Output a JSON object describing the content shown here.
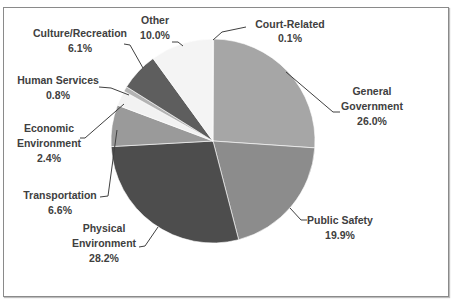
{
  "chart_data": {
    "type": "pie",
    "title": "",
    "start_angle": "12 o'clock, clockwise",
    "categories": [
      "Court-Related",
      "General Government",
      "Public Safety",
      "Physical Environment",
      "Transportation",
      "Economic Environment",
      "Human Services",
      "Culture/Recreation",
      "Other"
    ],
    "values": [
      0.1,
      26.0,
      19.9,
      28.2,
      6.6,
      2.4,
      0.8,
      6.1,
      10.0
    ],
    "unit": "%",
    "colors": [
      "#7f7f7f",
      "#a6a6a6",
      "#8c8c8c",
      "#4d4d4d",
      "#9a9a9a",
      "#f2f2f2",
      "#b3b3b3",
      "#5e5e5e",
      "#f4f4f4"
    ],
    "labels": [
      {
        "name": "Court-Related",
        "value": "0.1%"
      },
      {
        "name": "General Government",
        "value": "26.0%"
      },
      {
        "name": "Public Safety",
        "value": "19.9%"
      },
      {
        "name": "Physical Environment",
        "value": "28.2%"
      },
      {
        "name": "Transportation",
        "value": "6.6%"
      },
      {
        "name": "Economic Environment",
        "value": "2.4%"
      },
      {
        "name": "Human Services",
        "value": "0.8%"
      },
      {
        "name": "Culture/Recreation",
        "value": "6.1%"
      },
      {
        "name": "Other",
        "value": "10.0%"
      }
    ],
    "legend": "none (data labels with leader lines)"
  },
  "text": {
    "court_1": "Court-Related",
    "court_2": "0.1%",
    "gen_1": "General",
    "gen_2": "Government",
    "gen_3": "26.0%",
    "ps_1": "Public Safety",
    "ps_2": "19.9%",
    "pe_1": "Physical",
    "pe_2": "Environment",
    "pe_3": "28.2%",
    "tr_1": "Transportation",
    "tr_2": "6.6%",
    "ee_1": "Economic",
    "ee_2": "Environment",
    "ee_3": "2.4%",
    "hs_1": "Human Services",
    "hs_2": "0.8%",
    "cr_1": "Culture/Recreation",
    "cr_2": "6.1%",
    "ot_1": "Other",
    "ot_2": "10.0%"
  }
}
